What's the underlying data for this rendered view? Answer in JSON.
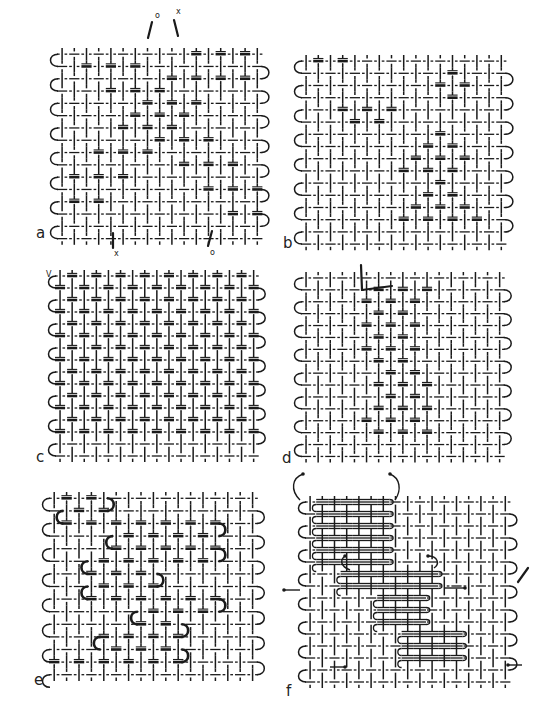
{
  "figure": {
    "background": "#ffffff",
    "ink": "#1a1a1a",
    "panels": [
      {
        "id": "a",
        "label": "a",
        "x": 56,
        "y": 48,
        "cols": 17,
        "rows": 16,
        "cw": 12.2,
        "rh": 12.3,
        "label_pos": [
          36,
          238
        ],
        "pattern": "diagonal-steps",
        "heavy": [
          [
            0,
            10,
            16
          ],
          [
            1,
            1,
            6
          ],
          [
            2,
            9,
            15
          ],
          [
            3,
            4,
            9
          ],
          [
            4,
            7,
            12
          ],
          [
            5,
            6,
            11
          ],
          [
            6,
            5,
            10
          ],
          [
            7,
            8,
            13
          ],
          [
            8,
            2,
            7
          ],
          [
            9,
            9,
            14
          ],
          [
            10,
            0,
            6
          ],
          [
            11,
            11,
            16
          ],
          [
            12,
            0,
            4
          ],
          [
            13,
            13,
            17
          ],
          [
            14,
            0,
            0
          ],
          [
            15,
            0,
            0
          ]
        ],
        "marks": [
          {
            "text": "o",
            "x": 155,
            "y": 18
          },
          {
            "text": "x",
            "x": 176,
            "y": 14
          },
          {
            "text": "x",
            "x": 114,
            "y": 256
          },
          {
            "text": "o",
            "x": 210,
            "y": 255
          }
        ],
        "threads": [
          {
            "x1": 152,
            "y1": 22,
            "x2": 148,
            "y2": 38
          },
          {
            "x1": 174,
            "y1": 20,
            "x2": 178,
            "y2": 36
          },
          {
            "x1": 113,
            "y1": 233,
            "x2": 113,
            "y2": 248
          },
          {
            "x1": 212,
            "y1": 231,
            "x2": 208,
            "y2": 246
          }
        ]
      },
      {
        "id": "b",
        "label": "b",
        "x": 300,
        "y": 55,
        "cols": 17,
        "rows": 16,
        "cw": 12.2,
        "rh": 12.2,
        "label_pos": [
          283,
          248
        ],
        "pattern": "scattered",
        "heavy": [
          [
            0,
            0,
            3
          ],
          [
            1,
            0,
            3
          ],
          [
            1,
            5,
            6
          ],
          [
            1,
            12,
            13
          ],
          [
            2,
            5,
            8
          ],
          [
            2,
            11,
            13
          ],
          [
            3,
            4,
            8
          ],
          [
            3,
            12,
            13
          ],
          [
            4,
            3,
            7
          ],
          [
            5,
            0,
            1
          ],
          [
            5,
            4,
            7
          ],
          [
            6,
            1,
            2
          ],
          [
            6,
            6,
            7
          ],
          [
            6,
            11,
            12
          ],
          [
            7,
            0,
            1
          ],
          [
            7,
            6,
            7
          ],
          [
            7,
            10,
            13
          ],
          [
            8,
            3,
            4
          ],
          [
            8,
            9,
            13
          ],
          [
            9,
            1,
            5
          ],
          [
            9,
            8,
            13
          ],
          [
            10,
            1,
            4
          ],
          [
            10,
            10,
            11
          ],
          [
            11,
            0,
            4
          ],
          [
            11,
            9,
            13
          ],
          [
            12,
            4,
            5
          ],
          [
            12,
            9,
            13
          ],
          [
            13,
            1,
            6
          ],
          [
            13,
            8,
            14
          ],
          [
            14,
            0,
            0
          ],
          [
            15,
            0,
            0
          ]
        ],
        "marks": [],
        "threads": []
      },
      {
        "id": "c",
        "label": "c",
        "x": 54,
        "y": 270,
        "cols": 17,
        "rows": 16,
        "cw": 12.1,
        "rh": 12.0,
        "label_pos": [
          36,
          462
        ],
        "pattern": "dense",
        "heavy": [
          [
            0,
            0,
            16
          ],
          [
            1,
            0,
            16
          ],
          [
            2,
            0,
            16
          ],
          [
            3,
            0,
            16
          ],
          [
            4,
            0,
            16
          ],
          [
            5,
            0,
            16
          ],
          [
            6,
            0,
            16
          ],
          [
            7,
            0,
            16
          ],
          [
            8,
            0,
            16
          ],
          [
            9,
            0,
            16
          ],
          [
            10,
            0,
            16
          ],
          [
            11,
            0,
            16
          ],
          [
            12,
            0,
            16
          ],
          [
            13,
            0,
            16
          ],
          [
            14,
            0,
            0
          ],
          [
            15,
            0,
            0
          ]
        ],
        "marks": [
          {
            "text": "V",
            "x": 46,
            "y": 277
          }
        ],
        "threads": []
      },
      {
        "id": "d",
        "label": "d",
        "x": 300,
        "y": 272,
        "cols": 17,
        "rows": 16,
        "cw": 12.1,
        "rh": 11.9,
        "label_pos": [
          282,
          463
        ],
        "pattern": "center-block",
        "heavy": [
          [
            1,
            6,
            10
          ],
          [
            2,
            5,
            10
          ],
          [
            3,
            6,
            9
          ],
          [
            4,
            5,
            10
          ],
          [
            5,
            6,
            9
          ],
          [
            6,
            5,
            10
          ],
          [
            7,
            5,
            9
          ],
          [
            8,
            6,
            9
          ],
          [
            9,
            5,
            10
          ],
          [
            10,
            6,
            9
          ],
          [
            11,
            5,
            10
          ],
          [
            12,
            5,
            9
          ],
          [
            13,
            5,
            10
          ]
        ],
        "marks": [],
        "threads": [
          {
            "x1": 361,
            "y1": 265,
            "x2": 362,
            "y2": 290
          },
          {
            "x1": 362,
            "y1": 290,
            "x2": 392,
            "y2": 286
          }
        ]
      },
      {
        "id": "e",
        "label": "e",
        "x": 48,
        "y": 492,
        "cols": 17,
        "rows": 15,
        "cw": 12.4,
        "rh": 12.6,
        "label_pos": [
          34,
          685
        ],
        "pattern": "meander",
        "heavy": [
          [
            0,
            0,
            3
          ],
          [
            1,
            1,
            4
          ],
          [
            2,
            1,
            13
          ],
          [
            3,
            5,
            13
          ],
          [
            4,
            5,
            13
          ],
          [
            5,
            3,
            13
          ],
          [
            6,
            3,
            8
          ],
          [
            7,
            3,
            8
          ],
          [
            8,
            3,
            13
          ],
          [
            9,
            7,
            13
          ],
          [
            10,
            7,
            10
          ],
          [
            11,
            4,
            10
          ],
          [
            12,
            4,
            10
          ],
          [
            13,
            0,
            10
          ]
        ],
        "turns": [
          {
            "row": 0,
            "side": "r",
            "col": 4
          },
          {
            "row": 1,
            "side": "l",
            "col": 1
          },
          {
            "row": 2,
            "side": "r",
            "col": 13
          },
          {
            "row": 3,
            "side": "l",
            "col": 5
          },
          {
            "row": 4,
            "side": "r",
            "col": 13
          },
          {
            "row": 5,
            "side": "l",
            "col": 3
          },
          {
            "row": 6,
            "side": "r",
            "col": 8
          },
          {
            "row": 7,
            "side": "l",
            "col": 3
          },
          {
            "row": 8,
            "side": "r",
            "col": 13
          },
          {
            "row": 9,
            "side": "l",
            "col": 7
          },
          {
            "row": 10,
            "side": "r",
            "col": 10
          },
          {
            "row": 11,
            "side": "l",
            "col": 4
          },
          {
            "row": 12,
            "side": "r",
            "col": 10
          }
        ],
        "marks": [],
        "threads": []
      },
      {
        "id": "f",
        "label": "f",
        "x": 304,
        "y": 496,
        "cols": 17,
        "rows": 16,
        "cw": 12.2,
        "rh": 12.0,
        "label_pos": [
          286,
          696
        ],
        "pattern": "interlock",
        "heavy": [],
        "dense_blocks": [
          {
            "r0": 0,
            "r1": 6,
            "c0": 1,
            "c1": 6
          },
          {
            "r0": 6,
            "r1": 8,
            "c0": 3,
            "c1": 10
          },
          {
            "r0": 8,
            "r1": 11,
            "c0": 6,
            "c1": 9
          },
          {
            "r0": 11,
            "r1": 14,
            "c0": 8,
            "c1": 12
          }
        ],
        "arrows": [
          {
            "path": "M300,500 C290,490 292,478 303,474",
            "head": [
              303,
              474
            ]
          },
          {
            "path": "M395,500 C402,490 400,478 390,474",
            "head": [
              390,
              474
            ]
          },
          {
            "path": "M300,590 L284,590",
            "head": [
              284,
              590
            ]
          },
          {
            "path": "M445,588 L465,588",
            "head": [
              465,
              588
            ]
          },
          {
            "path": "M330,667 L345,667",
            "head": [
              345,
              667
            ]
          },
          {
            "path": "M522,665 L508,665",
            "head": [
              508,
              665
            ]
          },
          {
            "path": "M428,556 C438,556 440,564 434,568",
            "head": [
              428,
              556
            ]
          },
          {
            "path": "M350,570 C340,566 340,560 345,556",
            "head": [
              345,
              556
            ]
          }
        ],
        "marks": [],
        "threads": [
          {
            "x1": 518,
            "y1": 582,
            "x2": 528,
            "y2": 568
          }
        ]
      }
    ]
  }
}
